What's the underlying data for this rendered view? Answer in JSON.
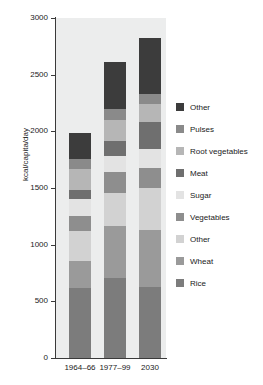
{
  "chart_data": {
    "type": "bar",
    "stacked": true,
    "title": "",
    "xlabel": "",
    "ylabel": "kcal/capita/day",
    "ylim": [
      0,
      3000
    ],
    "yticks": [
      0,
      500,
      1000,
      1500,
      2000,
      2500,
      3000
    ],
    "ytick_labels": [
      "0",
      "500",
      "1000",
      "1500",
      "2000",
      "2500",
      "3000"
    ],
    "grid": false,
    "legend_position": "right",
    "plot_background": "#eceded",
    "categories": [
      "1964–66",
      "1977–99",
      "2030"
    ],
    "series": [
      {
        "name": "Rice",
        "color": "#7c7c7c",
        "values": [
          620,
          705,
          630
        ]
      },
      {
        "name": "Wheat",
        "color": "#9a9a9a",
        "values": [
          235,
          460,
          500
        ]
      },
      {
        "name": "Other",
        "color": "#d2d2d2",
        "values": [
          270,
          295,
          370
        ]
      },
      {
        "name": "Vegetables",
        "color": "#8e8e8e",
        "values": [
          125,
          180,
          175
        ]
      },
      {
        "name": "Sugar",
        "color": "#e3e3e3",
        "values": [
          150,
          140,
          170
        ]
      },
      {
        "name": "Meat",
        "color": "#6f6f6f",
        "values": [
          80,
          135,
          240
        ]
      },
      {
        "name": "Root vegetables",
        "color": "#b6b6b6",
        "values": [
          185,
          185,
          160
        ]
      },
      {
        "name": "Pulses",
        "color": "#8a8a8a",
        "values": [
          90,
          100,
          85
        ]
      },
      {
        "name": "Other",
        "color": "#3c3c3c",
        "values": [
          230,
          410,
          495
        ]
      }
    ],
    "totals": [
      1985,
      2610,
      2825
    ]
  },
  "legend": {
    "entries": [
      {
        "label": "Other",
        "color": "#3c3c3c"
      },
      {
        "label": "Pulses",
        "color": "#8a8a8a"
      },
      {
        "label": "Root vegetables",
        "color": "#b6b6b6"
      },
      {
        "label": "Meat",
        "color": "#6f6f6f"
      },
      {
        "label": "Sugar",
        "color": "#e3e3e3"
      },
      {
        "label": "Vegetables",
        "color": "#8e8e8e"
      },
      {
        "label": "Other",
        "color": "#d2d2d2"
      },
      {
        "label": "Wheat",
        "color": "#9a9a9a"
      },
      {
        "label": "Rice",
        "color": "#7c7c7c"
      }
    ]
  }
}
